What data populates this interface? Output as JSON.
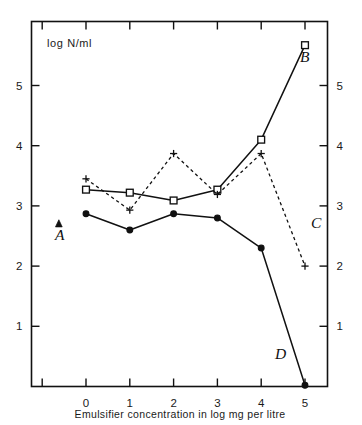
{
  "figure": {
    "title": "",
    "y_axis_caption": "log N/ml",
    "x_axis_caption": "Emulsifier concentration in log mg per litre",
    "left_axis_ticks": [
      "5",
      "4",
      "3",
      "2",
      "1"
    ],
    "right_axis_ticks": [
      "5",
      "4",
      "3",
      "2",
      "1"
    ],
    "x_axis_ticks": [
      "0",
      "1",
      "2",
      "3",
      "4",
      "5"
    ],
    "series_labels": {
      "a": "A",
      "b": "B",
      "c": "C",
      "d": "D"
    },
    "ink_color": "#111111",
    "background_color": "#ffffff"
  },
  "chart_data": {
    "type": "line",
    "title": "",
    "xlabel": "Emulsifier concentration in log mg per litre",
    "ylabel": "log N/ml",
    "xlim": [
      -1.2,
      5.35
    ],
    "ylim": [
      0,
      6.0
    ],
    "xticks": [
      0,
      1,
      2,
      3,
      4,
      5
    ],
    "yticks": [
      1,
      2,
      3,
      4,
      5
    ],
    "grid": false,
    "legend": "inline-labels",
    "series": [
      {
        "name": "A",
        "label": "A",
        "marker": "filled-triangle",
        "linestyle": "none",
        "x": [
          -0.62
        ],
        "values": [
          2.7
        ]
      },
      {
        "name": "B",
        "label": "B",
        "marker": "open-square",
        "linestyle": "solid",
        "x": [
          0,
          1,
          2,
          3,
          4,
          5
        ],
        "values": [
          3.27,
          3.22,
          3.09,
          3.27,
          4.1,
          5.67
        ]
      },
      {
        "name": "C",
        "label": "C",
        "marker": "plus",
        "linestyle": "dashed",
        "x": [
          0,
          1,
          2,
          3,
          4,
          5
        ],
        "values": [
          3.45,
          2.93,
          3.87,
          3.19,
          3.87,
          2.0
        ]
      },
      {
        "name": "D",
        "label": "D",
        "marker": "filled-circle",
        "linestyle": "solid",
        "x": [
          0,
          1,
          2,
          3,
          4,
          5
        ],
        "values": [
          2.87,
          2.6,
          2.87,
          2.8,
          2.3,
          0.02
        ]
      }
    ]
  }
}
